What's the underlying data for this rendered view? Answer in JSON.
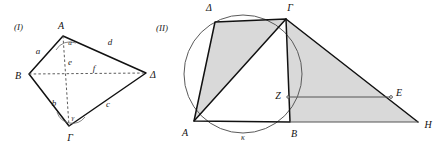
{
  "figures": [
    {
      "id": "figure-I",
      "caption": "(I)",
      "description": "Quadrilateral with labeled sides, diagonals and angles",
      "vertices": [
        {
          "name": "A",
          "label": "A",
          "x": 61,
          "y": 29
        },
        {
          "name": "B",
          "label": "B",
          "x": 34,
          "y": 76
        },
        {
          "name": "Gamma",
          "label": "Γ",
          "x": 72,
          "y": 126
        },
        {
          "name": "Delta",
          "label": "Δ",
          "x": 146,
          "y": 75
        }
      ],
      "side_labels": [
        {
          "name": "side-a",
          "label": "a",
          "x": 38,
          "y": 52
        },
        {
          "name": "side-b",
          "label": "b",
          "x": 57,
          "y": 104
        },
        {
          "name": "side-c",
          "label": "c",
          "x": 106,
          "y": 105
        },
        {
          "name": "side-d",
          "label": "d",
          "x": 108,
          "y": 47
        }
      ],
      "diagonal_labels": [
        {
          "name": "diagonal-e",
          "label": "e",
          "x": 66,
          "y": 62
        },
        {
          "name": "diagonal-f",
          "label": "f",
          "x": 94,
          "y": 70
        }
      ],
      "angle_labels": [
        {
          "name": "angle-alpha-at-A",
          "label": "α",
          "x": 65,
          "y": 43
        },
        {
          "name": "angle-gamma-at-Gamma",
          "label": "γ",
          "x": 73,
          "y": 119
        }
      ]
    },
    {
      "id": "figure-II",
      "caption": "(II)",
      "description": "Cyclic quadrilateral inscribed in circle kappa with extended shaded triangle",
      "vertices": [
        {
          "name": "Delta",
          "label": "Δ",
          "x": 209,
          "y": 11
        },
        {
          "name": "Gamma",
          "label": "Γ",
          "x": 288,
          "y": 11
        },
        {
          "name": "A",
          "label": "A",
          "x": 187,
          "y": 133
        },
        {
          "name": "B",
          "label": "B",
          "x": 293,
          "y": 134
        },
        {
          "name": "Z",
          "label": "Z",
          "x": 281,
          "y": 101
        },
        {
          "name": "E",
          "label": "E",
          "x": 397,
          "y": 100
        },
        {
          "name": "H",
          "label": "H",
          "x": 424,
          "y": 126
        }
      ],
      "circle_label": {
        "name": "circle-kappa",
        "label": "κ",
        "x": 243,
        "y": 138
      },
      "circle": {
        "cx": 243,
        "cy": 74,
        "r": 59
      },
      "points": {
        "A": {
          "x": 194,
          "y": 121
        },
        "B": {
          "x": 290,
          "y": 122
        },
        "Gamma": {
          "x": 286,
          "y": 19
        },
        "Delta": {
          "x": 215,
          "y": 22
        },
        "Z": {
          "x": 288,
          "y": 97
        },
        "E": {
          "x": 391,
          "y": 97
        },
        "H": {
          "x": 418,
          "y": 122
        }
      }
    }
  ],
  "colors": {
    "stroke": "#111111",
    "thin_stroke": "#555555",
    "shade_fill": "#d2d2d2",
    "circle_stroke": "#5a5a5a",
    "background": "#ffffff"
  }
}
